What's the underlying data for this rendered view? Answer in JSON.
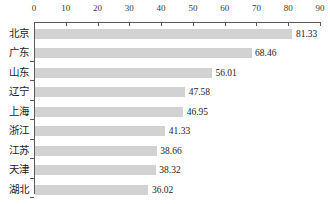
{
  "chart_data": {
    "type": "bar",
    "orientation": "horizontal",
    "title": "",
    "xlabel": "",
    "ylabel": "",
    "xlim": [
      0,
      90
    ],
    "xticks": [
      0,
      10,
      20,
      30,
      40,
      50,
      60,
      70,
      80,
      90
    ],
    "grid": false,
    "legend": false,
    "axis_position": "top",
    "bar_color": "#d2d2d2",
    "axis_color": "#5a5a5a",
    "text_color": "#1c1c1c",
    "categories": [
      "北京",
      "广东",
      "山东",
      "辽宁",
      "上海",
      "浙江",
      "江苏",
      "天津",
      "湖北"
    ],
    "values": [
      81.33,
      68.46,
      56.01,
      47.58,
      46.95,
      41.33,
      38.66,
      38.32,
      36.02
    ],
    "value_labels": [
      "81.33",
      "68.46",
      "56.01",
      "47.58",
      "46.95",
      "41.33",
      "38.66",
      "38.32",
      "36.02"
    ],
    "tick_labels": [
      "0",
      "10",
      "20",
      "30",
      "40",
      "50",
      "60",
      "70",
      "80",
      "90"
    ]
  }
}
